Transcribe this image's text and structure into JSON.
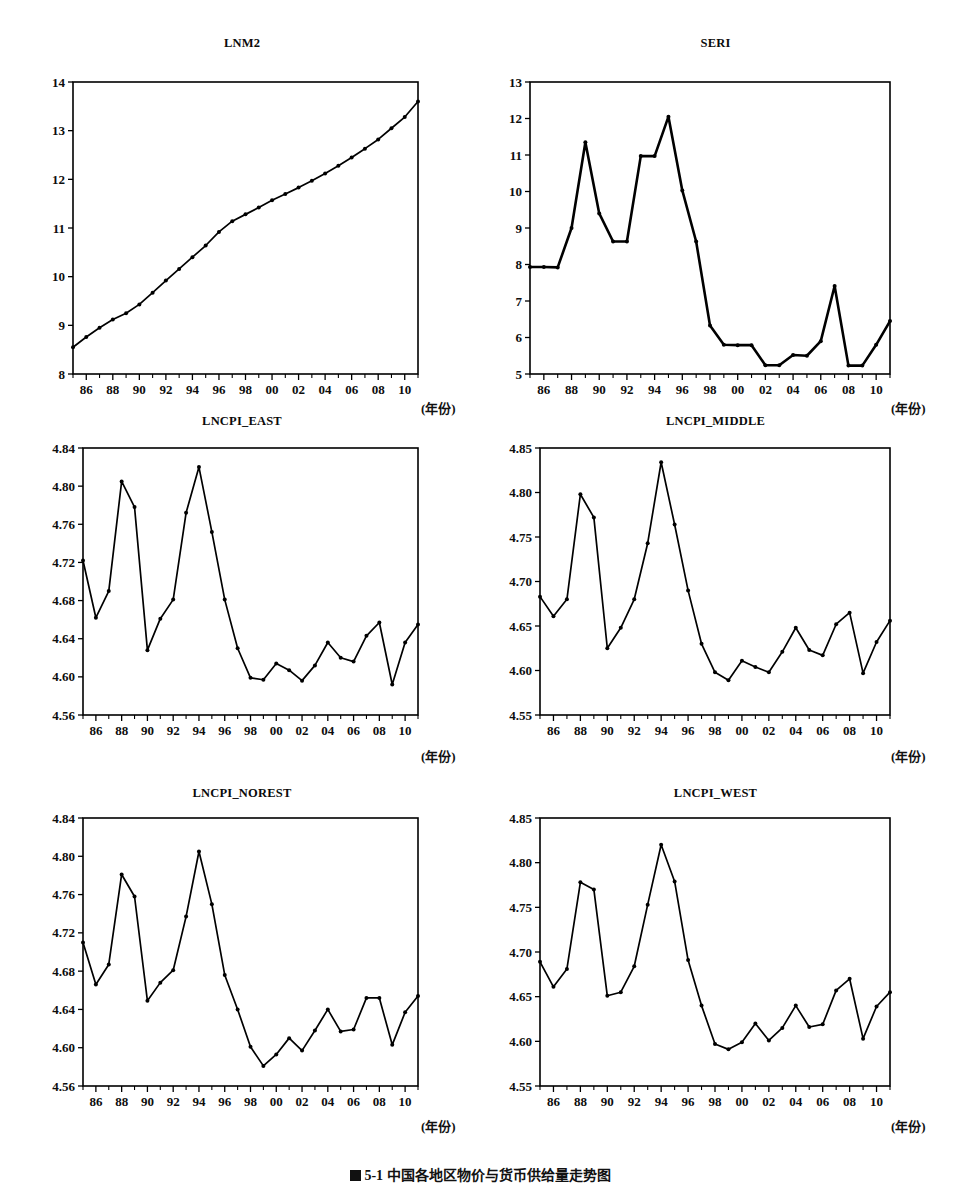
{
  "figure": {
    "caption_marker": "图",
    "caption": "5-1   中国各地区物价与货币供给量走势图",
    "background": "#ffffff",
    "ink": "#000000",
    "xaxis_unit_label": "(年份)"
  },
  "chart_data": [
    {
      "id": "lnm2",
      "type": "line",
      "title": "LNM2",
      "xlabel": "(年份)",
      "ylabel": "",
      "xlim": [
        1985,
        2011
      ],
      "ylim": [
        8,
        14
      ],
      "yticks": [
        8,
        9,
        10,
        11,
        12,
        13,
        14
      ],
      "ytick_labels": [
        "8",
        "9",
        "10",
        "11",
        "12",
        "13",
        "14"
      ],
      "xticks": [
        1986,
        1988,
        1990,
        1992,
        1994,
        1996,
        1998,
        2000,
        2002,
        2004,
        2006,
        2008,
        2010
      ],
      "xtick_labels": [
        "86",
        "88",
        "90",
        "92",
        "94",
        "96",
        "98",
        "00",
        "02",
        "04",
        "06",
        "08",
        "10"
      ],
      "grid": false,
      "markers": true,
      "line_weight": "normal",
      "x": [
        1985,
        1986,
        1987,
        1988,
        1989,
        1990,
        1991,
        1992,
        1993,
        1994,
        1995,
        1996,
        1997,
        1998,
        1999,
        2000,
        2001,
        2002,
        2003,
        2004,
        2005,
        2006,
        2007,
        2008,
        2009,
        2010,
        2011
      ],
      "values": [
        8.55,
        8.76,
        8.95,
        9.12,
        9.25,
        9.43,
        9.67,
        9.92,
        10.16,
        10.4,
        10.64,
        10.92,
        11.14,
        11.28,
        11.42,
        11.57,
        11.7,
        11.83,
        11.97,
        12.12,
        12.28,
        12.45,
        12.63,
        12.82,
        13.05,
        13.28,
        13.6
      ]
    },
    {
      "id": "seri",
      "type": "line",
      "title": "SERI",
      "xlabel": "(年份)",
      "ylabel": "",
      "xlim": [
        1985,
        2011
      ],
      "ylim": [
        5,
        13
      ],
      "yticks": [
        5,
        6,
        7,
        8,
        9,
        10,
        11,
        12,
        13
      ],
      "ytick_labels": [
        "5",
        "6",
        "7",
        "8",
        "9",
        "10",
        "11",
        "12",
        "13"
      ],
      "xticks": [
        1986,
        1988,
        1990,
        1992,
        1994,
        1996,
        1998,
        2000,
        2002,
        2004,
        2006,
        2008,
        2010
      ],
      "xtick_labels": [
        "86",
        "88",
        "90",
        "92",
        "94",
        "96",
        "98",
        "00",
        "02",
        "04",
        "06",
        "08",
        "10"
      ],
      "grid": false,
      "markers": true,
      "line_weight": "thick",
      "x": [
        1985,
        1986,
        1987,
        1988,
        1989,
        1990,
        1991,
        1992,
        1993,
        1994,
        1995,
        1996,
        1997,
        1998,
        1999,
        2000,
        2001,
        2002,
        2003,
        2004,
        2005,
        2006,
        2007,
        2008,
        2009,
        2010,
        2011
      ],
      "values": [
        7.93,
        7.93,
        7.92,
        9.0,
        11.35,
        9.4,
        8.63,
        8.63,
        10.97,
        10.97,
        12.05,
        10.03,
        8.63,
        6.33,
        5.8,
        5.79,
        5.79,
        5.24,
        5.24,
        5.52,
        5.5,
        5.9,
        7.41,
        5.23,
        5.23,
        5.8,
        6.45
      ]
    },
    {
      "id": "lncpi_east",
      "type": "line",
      "title": "LNCPI_EAST",
      "xlabel": "(年份)",
      "ylabel": "",
      "xlim": [
        1985,
        2011
      ],
      "ylim": [
        4.56,
        4.84
      ],
      "yticks": [
        4.56,
        4.6,
        4.64,
        4.68,
        4.72,
        4.76,
        4.8,
        4.84
      ],
      "ytick_labels": [
        "4.56",
        "4.60",
        "4.64",
        "4.68",
        "4.72",
        "4.76",
        "4.80",
        "4.84"
      ],
      "xticks": [
        1986,
        1988,
        1990,
        1992,
        1994,
        1996,
        1998,
        2000,
        2002,
        2004,
        2006,
        2008,
        2010
      ],
      "xtick_labels": [
        "86",
        "88",
        "90",
        "92",
        "94",
        "96",
        "98",
        "00",
        "02",
        "04",
        "06",
        "08",
        "10"
      ],
      "grid": false,
      "markers": true,
      "line_weight": "normal",
      "x": [
        1985,
        1986,
        1987,
        1988,
        1989,
        1990,
        1991,
        1992,
        1993,
        1994,
        1995,
        1996,
        1997,
        1998,
        1999,
        2000,
        2001,
        2002,
        2003,
        2004,
        2005,
        2006,
        2007,
        2008,
        2009,
        2010,
        2011
      ],
      "values": [
        4.722,
        4.662,
        4.69,
        4.805,
        4.778,
        4.628,
        4.661,
        4.681,
        4.772,
        4.82,
        4.752,
        4.681,
        4.63,
        4.599,
        4.597,
        4.614,
        4.607,
        4.596,
        4.612,
        4.636,
        4.62,
        4.616,
        4.643,
        4.657,
        4.592,
        4.636,
        4.655
      ]
    },
    {
      "id": "lncpi_middle",
      "type": "line",
      "title": "LNCPI_MIDDLE",
      "xlabel": "(年份)",
      "ylabel": "",
      "xlim": [
        1985,
        2011
      ],
      "ylim": [
        4.55,
        4.85
      ],
      "yticks": [
        4.55,
        4.6,
        4.65,
        4.7,
        4.75,
        4.8,
        4.85
      ],
      "ytick_labels": [
        "4.55",
        "4.60",
        "4.65",
        "4.70",
        "4.75",
        "4.80",
        "4.85"
      ],
      "xticks": [
        1986,
        1988,
        1990,
        1992,
        1994,
        1996,
        1998,
        2000,
        2002,
        2004,
        2006,
        2008,
        2010
      ],
      "xtick_labels": [
        "86",
        "88",
        "90",
        "92",
        "94",
        "96",
        "98",
        "00",
        "02",
        "04",
        "06",
        "08",
        "10"
      ],
      "grid": false,
      "markers": true,
      "line_weight": "normal",
      "x": [
        1985,
        1986,
        1987,
        1988,
        1989,
        1990,
        1991,
        1992,
        1993,
        1994,
        1995,
        1996,
        1997,
        1998,
        1999,
        2000,
        2001,
        2002,
        2003,
        2004,
        2005,
        2006,
        2007,
        2008,
        2009,
        2010,
        2011
      ],
      "values": [
        4.683,
        4.661,
        4.68,
        4.798,
        4.772,
        4.625,
        4.648,
        4.68,
        4.743,
        4.834,
        4.764,
        4.69,
        4.63,
        4.598,
        4.589,
        4.611,
        4.604,
        4.598,
        4.621,
        4.648,
        4.623,
        4.617,
        4.652,
        4.665,
        4.597,
        4.632,
        4.656
      ]
    },
    {
      "id": "lncpi_norest",
      "type": "line",
      "title": "LNCPI_NOREST",
      "xlabel": "(年份)",
      "ylabel": "",
      "xlim": [
        1985,
        2011
      ],
      "ylim": [
        4.56,
        4.84
      ],
      "yticks": [
        4.56,
        4.6,
        4.64,
        4.68,
        4.72,
        4.76,
        4.8,
        4.84
      ],
      "ytick_labels": [
        "4.56",
        "4.60",
        "4.64",
        "4.68",
        "4.72",
        "4.76",
        "4.80",
        "4.84"
      ],
      "xticks": [
        1986,
        1988,
        1990,
        1992,
        1994,
        1996,
        1998,
        2000,
        2002,
        2004,
        2006,
        2008,
        2010
      ],
      "xtick_labels": [
        "86",
        "88",
        "90",
        "92",
        "94",
        "96",
        "98",
        "00",
        "02",
        "04",
        "06",
        "08",
        "10"
      ],
      "grid": false,
      "markers": true,
      "line_weight": "normal",
      "x": [
        1985,
        1986,
        1987,
        1988,
        1989,
        1990,
        1991,
        1992,
        1993,
        1994,
        1995,
        1996,
        1997,
        1998,
        1999,
        2000,
        2001,
        2002,
        2003,
        2004,
        2005,
        2006,
        2007,
        2008,
        2009,
        2010,
        2011
      ],
      "values": [
        4.71,
        4.666,
        4.687,
        4.781,
        4.758,
        4.649,
        4.668,
        4.681,
        4.737,
        4.805,
        4.75,
        4.676,
        4.64,
        4.601,
        4.581,
        4.593,
        4.61,
        4.597,
        4.618,
        4.64,
        4.617,
        4.619,
        4.652,
        4.652,
        4.603,
        4.637,
        4.654
      ]
    },
    {
      "id": "lncpi_west",
      "type": "line",
      "title": "LNCPI_WEST",
      "xlabel": "(年份)",
      "ylabel": "",
      "xlim": [
        1985,
        2011
      ],
      "ylim": [
        4.55,
        4.85
      ],
      "yticks": [
        4.55,
        4.6,
        4.65,
        4.7,
        4.75,
        4.8,
        4.85
      ],
      "ytick_labels": [
        "4.55",
        "4.60",
        "4.65",
        "4.70",
        "4.75",
        "4.80",
        "4.85"
      ],
      "xticks": [
        1986,
        1988,
        1990,
        1992,
        1994,
        1996,
        1998,
        2000,
        2002,
        2004,
        2006,
        2008,
        2010
      ],
      "xtick_labels": [
        "86",
        "88",
        "90",
        "92",
        "94",
        "96",
        "98",
        "00",
        "02",
        "04",
        "06",
        "08",
        "10"
      ],
      "grid": false,
      "markers": true,
      "line_weight": "normal",
      "x": [
        1985,
        1986,
        1987,
        1988,
        1989,
        1990,
        1991,
        1992,
        1993,
        1994,
        1995,
        1996,
        1997,
        1998,
        1999,
        2000,
        2001,
        2002,
        2003,
        2004,
        2005,
        2006,
        2007,
        2008,
        2009,
        2010,
        2011
      ],
      "values": [
        4.689,
        4.661,
        4.681,
        4.778,
        4.77,
        4.651,
        4.655,
        4.684,
        4.753,
        4.82,
        4.779,
        4.691,
        4.64,
        4.597,
        4.591,
        4.599,
        4.62,
        4.601,
        4.615,
        4.64,
        4.616,
        4.619,
        4.657,
        4.67,
        4.603,
        4.639,
        4.655
      ]
    }
  ],
  "panels": [
    {
      "id": "lnm2",
      "left": 8,
      "top": 36,
      "width": 468,
      "height": 384,
      "plot": {
        "x": 65,
        "y": 46,
        "w": 345,
        "h": 292
      },
      "unit_x": 413,
      "unit_y": 362
    },
    {
      "id": "seri",
      "left": 478,
      "top": 36,
      "width": 475,
      "height": 384,
      "plot": {
        "x": 52,
        "y": 46,
        "w": 360,
        "h": 292
      },
      "unit_x": 413,
      "unit_y": 362
    },
    {
      "id": "lncpi_east",
      "left": 8,
      "top": 414,
      "width": 468,
      "height": 376,
      "plot": {
        "x": 75,
        "y": 34,
        "w": 335,
        "h": 267
      },
      "unit_x": 413,
      "unit_y": 332
    },
    {
      "id": "lncpi_middle",
      "left": 478,
      "top": 414,
      "width": 475,
      "height": 376,
      "plot": {
        "x": 62,
        "y": 34,
        "w": 350,
        "h": 267
      },
      "unit_x": 413,
      "unit_y": 332
    },
    {
      "id": "lncpi_norest",
      "left": 8,
      "top": 786,
      "width": 468,
      "height": 380,
      "plot": {
        "x": 75,
        "y": 32,
        "w": 335,
        "h": 268
      },
      "unit_x": 413,
      "unit_y": 330
    },
    {
      "id": "lncpi_west",
      "left": 478,
      "top": 786,
      "width": 475,
      "height": 380,
      "plot": {
        "x": 62,
        "y": 32,
        "w": 350,
        "h": 268
      },
      "unit_x": 413,
      "unit_y": 330
    }
  ]
}
